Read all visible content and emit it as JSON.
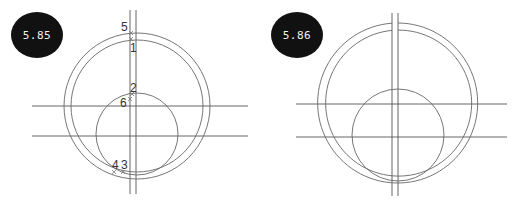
{
  "figures": [
    {
      "id": "left",
      "badge_label": "5.85",
      "point_labels": [
        "5",
        "1",
        "2",
        "6",
        "4",
        "3"
      ]
    },
    {
      "id": "right",
      "badge_label": "5.86",
      "point_labels": []
    }
  ],
  "colors": {
    "badge_bg": "#111111",
    "badge_text": "#f2f2f2",
    "line": "#555555",
    "background": "#ffffff"
  }
}
